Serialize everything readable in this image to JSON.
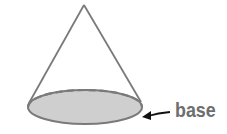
{
  "diagram": {
    "label": "base",
    "colors": {
      "outline": "#7a7a7a",
      "base_fill": "#cfcfcf",
      "label": "#6e6e6e",
      "arrow": "#111111"
    }
  }
}
